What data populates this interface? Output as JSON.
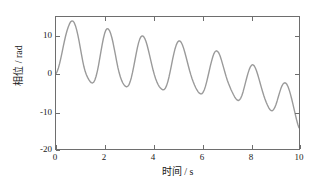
{
  "chart_data": {
    "type": "line",
    "title": "",
    "xlabel": "时间 / s",
    "ylabel": "相位 / rad",
    "xlim": [
      0,
      10
    ],
    "ylim": [
      -20,
      15
    ],
    "xticks": [
      0,
      2,
      4,
      6,
      8,
      10
    ],
    "xtick_labels": [
      "0",
      "2",
      "4",
      "6",
      "8",
      "10"
    ],
    "yticks": [
      10,
      0,
      -10,
      -20
    ],
    "ytick_labels": [
      "10",
      "0",
      "-10",
      "-20"
    ],
    "grid": false,
    "legend": null,
    "line_color": "#9a9a9a",
    "line_width": 1.4,
    "axis_color": "#6e6e6e",
    "background": "#ffffff",
    "series": [
      {
        "name": "相位",
        "x": [
          0.0,
          0.05,
          0.1,
          0.15,
          0.2,
          0.25,
          0.3,
          0.35,
          0.4,
          0.45,
          0.5,
          0.55,
          0.6,
          0.65,
          0.7,
          0.75,
          0.8,
          0.85,
          0.9,
          0.95,
          1.0,
          1.05,
          1.1,
          1.15,
          1.2,
          1.25,
          1.3,
          1.35,
          1.4,
          1.45,
          1.5,
          1.55,
          1.6,
          1.65,
          1.7,
          1.75,
          1.8,
          1.85,
          1.9,
          1.95,
          2.0,
          2.05,
          2.1,
          2.15,
          2.2,
          2.25,
          2.3,
          2.35,
          2.4,
          2.45,
          2.5,
          2.55,
          2.6,
          2.65,
          2.7,
          2.75,
          2.8,
          2.85,
          2.9,
          2.95,
          3.0,
          3.05,
          3.1,
          3.15,
          3.2,
          3.25,
          3.3,
          3.35,
          3.4,
          3.45,
          3.5,
          3.55,
          3.6,
          3.65,
          3.7,
          3.75,
          3.8,
          3.85,
          3.9,
          3.95,
          4.0,
          4.05,
          4.1,
          4.15,
          4.2,
          4.25,
          4.3,
          4.35,
          4.4,
          4.45,
          4.5,
          4.55,
          4.6,
          4.65,
          4.7,
          4.75,
          4.8,
          4.85,
          4.9,
          4.95,
          5.0,
          5.05,
          5.1,
          5.15,
          5.2,
          5.25,
          5.3,
          5.35,
          5.4,
          5.45,
          5.5,
          5.55,
          5.6,
          5.65,
          5.7,
          5.75,
          5.8,
          5.85,
          5.9,
          5.95,
          6.0,
          6.05,
          6.1,
          6.15,
          6.2,
          6.25,
          6.3,
          6.35,
          6.4,
          6.45,
          6.5,
          6.55,
          6.6,
          6.65,
          6.7,
          6.75,
          6.8,
          6.85,
          6.9,
          6.95,
          7.0,
          7.05,
          7.1,
          7.15,
          7.2,
          7.25,
          7.3,
          7.35,
          7.4,
          7.45,
          7.5,
          7.55,
          7.6,
          7.65,
          7.7,
          7.75,
          7.8,
          7.85,
          7.9,
          7.95,
          8.0,
          8.05,
          8.1,
          8.15,
          8.2,
          8.25,
          8.3,
          8.35,
          8.4,
          8.45,
          8.5,
          8.55,
          8.6,
          8.65,
          8.7,
          8.75,
          8.8,
          8.85,
          8.9,
          8.95,
          9.0,
          9.05,
          9.1,
          9.15,
          9.2,
          9.25,
          9.3,
          9.35,
          9.4,
          9.45,
          9.5,
          9.55,
          9.6,
          9.65,
          9.7,
          9.75,
          9.8,
          9.85,
          9.9,
          9.95,
          10.0
        ],
        "y": [
          0.0,
          0.6,
          1.5,
          2.7,
          4.1,
          5.6,
          7.2,
          8.7,
          10.1,
          11.3,
          12.3,
          13.1,
          13.7,
          13.95,
          13.9,
          13.5,
          12.7,
          11.6,
          10.2,
          8.6,
          6.8,
          5.0,
          3.3,
          1.8,
          0.6,
          -0.3,
          -1.0,
          -1.6,
          -2.1,
          -2.4,
          -2.5,
          -2.3,
          -1.7,
          -0.7,
          0.6,
          2.2,
          4.0,
          5.9,
          7.7,
          9.3,
          10.6,
          11.5,
          11.9,
          11.85,
          11.4,
          10.6,
          9.5,
          8.1,
          6.5,
          4.8,
          3.1,
          1.5,
          0.2,
          -0.9,
          -1.8,
          -2.5,
          -3.0,
          -3.35,
          -3.5,
          -3.4,
          -3.0,
          -2.2,
          -1.1,
          0.3,
          1.9,
          3.6,
          5.3,
          6.9,
          8.2,
          9.2,
          9.8,
          10.0,
          9.85,
          9.35,
          8.55,
          7.5,
          6.25,
          4.9,
          3.5,
          2.1,
          0.8,
          -0.35,
          -1.35,
          -2.2,
          -2.9,
          -3.45,
          -3.85,
          -4.15,
          -4.3,
          -4.25,
          -3.9,
          -3.2,
          -2.2,
          -0.9,
          0.6,
          2.2,
          3.8,
          5.3,
          6.6,
          7.6,
          8.3,
          8.65,
          8.65,
          8.3,
          7.65,
          6.75,
          5.65,
          4.45,
          3.2,
          1.95,
          0.75,
          -0.35,
          -1.35,
          -2.25,
          -3.05,
          -3.75,
          -4.35,
          -4.85,
          -5.2,
          -5.4,
          -5.35,
          -5.0,
          -4.35,
          -3.4,
          -2.2,
          -0.85,
          0.55,
          1.95,
          3.25,
          4.4,
          5.3,
          5.85,
          6.05,
          5.9,
          5.45,
          4.7,
          3.75,
          2.65,
          1.5,
          0.35,
          -0.75,
          -1.75,
          -2.65,
          -3.45,
          -4.2,
          -4.9,
          -5.55,
          -6.15,
          -6.65,
          -7.0,
          -7.15,
          -7.0,
          -6.55,
          -5.8,
          -4.8,
          -3.6,
          -2.35,
          -1.1,
          0.05,
          1.05,
          1.8,
          2.25,
          2.35,
          2.1,
          1.55,
          0.75,
          -0.25,
          -1.35,
          -2.5,
          -3.65,
          -4.75,
          -5.8,
          -6.75,
          -7.6,
          -8.35,
          -9.0,
          -9.5,
          -9.8,
          -9.85,
          -9.6,
          -9.05,
          -8.25,
          -7.25,
          -6.15,
          -5.05,
          -4.05,
          -3.25,
          -2.7,
          -2.45,
          -2.5,
          -2.85,
          -3.5,
          -4.4,
          -5.5,
          -6.75,
          -8.1,
          -9.5,
          -10.9,
          -12.25,
          -13.45,
          -14.4
        ]
      }
    ],
    "peaks": [
      {
        "t": 0.65,
        "value": 13.95
      },
      {
        "t": 1.65,
        "value": 11.9
      },
      {
        "t": 2.6,
        "value": 10.0
      },
      {
        "t": 3.55,
        "value": 8.65
      },
      {
        "t": 4.55,
        "value": 8.3
      },
      {
        "t": 5.55,
        "value": 6.05
      },
      {
        "t": 6.5,
        "value": 2.35
      },
      {
        "t": 7.5,
        "value": -2.45
      },
      {
        "t": 8.5,
        "value": -2.8
      },
      {
        "t": 9.5,
        "value": -5.0
      }
    ],
    "troughs": [
      {
        "t": 1.1,
        "value": -2.5
      },
      {
        "t": 2.1,
        "value": -3.5
      },
      {
        "t": 3.05,
        "value": -4.3
      },
      {
        "t": 4.05,
        "value": -5.4
      },
      {
        "t": 5.05,
        "value": -7.15
      },
      {
        "t": 6.05,
        "value": -9.85
      },
      {
        "t": 7.05,
        "value": -12.4
      },
      {
        "t": 8.05,
        "value": -15.2
      },
      {
        "t": 9.05,
        "value": -17.3
      },
      {
        "t": 10.0,
        "value": -19.2
      }
    ]
  }
}
